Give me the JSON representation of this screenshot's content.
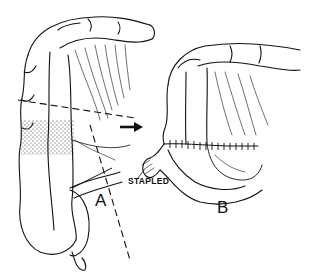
{
  "figure": {
    "type": "surgical illustration",
    "panels": [
      {
        "id": "A",
        "label": "A",
        "description": "colon segment with shaded (stippled) region to be resected, dashed cut lines"
      },
      {
        "id": "B",
        "label": "B",
        "description": "colon after resection with sutured end-to-side anastomosis and stapled stump"
      }
    ],
    "annotations": {
      "stapled_label": "STAPLED",
      "arrow": "right-arrow"
    },
    "colors": {
      "ink": "#111111",
      "background": "#ffffff"
    }
  }
}
